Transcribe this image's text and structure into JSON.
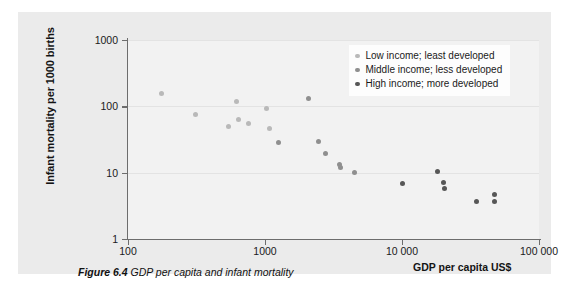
{
  "figure": {
    "caption_label": "Figure 6.4",
    "caption_text": "GDP per capita and infant mortality"
  },
  "chart_data": {
    "type": "scatter",
    "title": "",
    "xlabel": "GDP per capita US$",
    "ylabel": "Infant mortality per 1000 births",
    "xscale": "log",
    "yscale": "log",
    "xlim": [
      100,
      100000
    ],
    "ylim": [
      1,
      1000
    ],
    "xticks": [
      100,
      1000,
      10000,
      100000
    ],
    "xtick_labels": [
      "100",
      "1000",
      "10 000",
      "100 000"
    ],
    "yticks": [
      1,
      10,
      100,
      1000
    ],
    "ytick_labels": [
      "1",
      "10",
      "100",
      "1000"
    ],
    "grid": true,
    "legend_position": "top-right",
    "series": [
      {
        "name": "Low income; least developed",
        "color": "#b9b9b9",
        "points": [
          {
            "x": 175,
            "y": 155
          },
          {
            "x": 310,
            "y": 75
          },
          {
            "x": 540,
            "y": 49
          },
          {
            "x": 620,
            "y": 120
          },
          {
            "x": 640,
            "y": 64
          },
          {
            "x": 760,
            "y": 56
          },
          {
            "x": 1020,
            "y": 92
          },
          {
            "x": 1080,
            "y": 46
          }
        ]
      },
      {
        "name": "Middle income; less developed",
        "color": "#8f8f8f",
        "points": [
          {
            "x": 1250,
            "y": 29
          },
          {
            "x": 2080,
            "y": 133
          },
          {
            "x": 2450,
            "y": 30
          },
          {
            "x": 2750,
            "y": 19.5
          },
          {
            "x": 3500,
            "y": 13.5
          },
          {
            "x": 3550,
            "y": 11.8
          },
          {
            "x": 4500,
            "y": 10
          }
        ]
      },
      {
        "name": "High income; more developed",
        "color": "#575757",
        "points": [
          {
            "x": 10000,
            "y": 6.8
          },
          {
            "x": 18000,
            "y": 10.6
          },
          {
            "x": 20000,
            "y": 7.0
          },
          {
            "x": 20500,
            "y": 5.7
          },
          {
            "x": 35000,
            "y": 3.7
          },
          {
            "x": 47000,
            "y": 4.7
          },
          {
            "x": 47500,
            "y": 3.7
          }
        ]
      }
    ]
  }
}
